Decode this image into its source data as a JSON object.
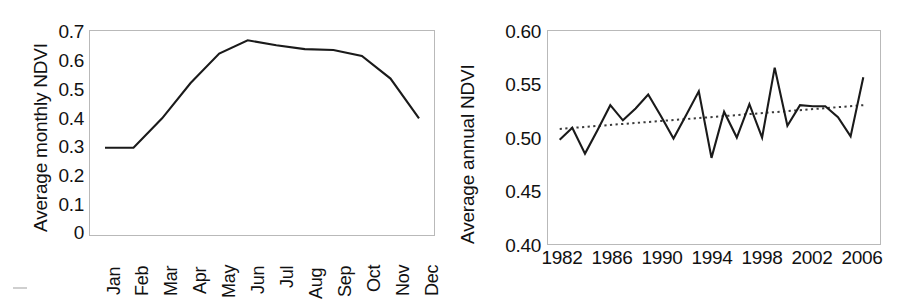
{
  "figure": {
    "background": "#ffffff",
    "line_color": "#1a1a1a",
    "trend_color": "#3a3a3a",
    "frame_color": "#b9b9b9"
  },
  "chart_data": [
    {
      "id": "monthly-ndvi",
      "type": "line",
      "title": "",
      "xlabel": "",
      "ylabel": "Average monthly NDVI",
      "categories": [
        "Jan",
        "Feb",
        "Mar",
        "Apr",
        "May",
        "Jun",
        "Jul",
        "Aug",
        "Sep",
        "Oct",
        "Nov",
        "Dec"
      ],
      "values": [
        0.3,
        0.3,
        0.4,
        0.52,
        0.62,
        0.665,
        0.648,
        0.635,
        0.632,
        0.612,
        0.535,
        0.4
      ],
      "ylim": [
        0,
        0.7
      ],
      "yticks": [
        "0.7",
        "0.6",
        "0.5",
        "0.4",
        "0.3",
        "0.2",
        "0.1",
        "0"
      ],
      "ytick_values": [
        0.7,
        0.6,
        0.5,
        0.4,
        0.3,
        0.2,
        0.1,
        0.0
      ],
      "grid": false,
      "legend": "none",
      "series": [
        {
          "name": "Average monthly NDVI",
          "style": "solid"
        }
      ]
    },
    {
      "id": "annual-ndvi",
      "type": "line",
      "title": "",
      "xlabel": "",
      "ylabel": "Average annual NDVI",
      "x": [
        1982,
        1983,
        1984,
        1985,
        1986,
        1987,
        1988,
        1989,
        1990,
        1991,
        1992,
        1993,
        1994,
        1995,
        1996,
        1997,
        1998,
        1999,
        2000,
        2001,
        2002,
        2003,
        2004,
        2005,
        2006
      ],
      "values": [
        0.498,
        0.509,
        0.485,
        0.507,
        0.53,
        0.516,
        0.527,
        0.54,
        0.52,
        0.499,
        0.521,
        0.543,
        0.481,
        0.524,
        0.5,
        0.531,
        0.5,
        0.565,
        0.511,
        0.53,
        0.529,
        0.529,
        0.519,
        0.501,
        0.556
      ],
      "trend": {
        "style": "dotted",
        "start_value": 0.508,
        "end_value": 0.53
      },
      "ylim": [
        0.4,
        0.6
      ],
      "yticks": [
        "0.60",
        "0.55",
        "0.50",
        "0.45",
        "0.40"
      ],
      "ytick_values": [
        0.6,
        0.55,
        0.5,
        0.45,
        0.4
      ],
      "xticks": [
        "1982",
        "1986",
        "1990",
        "1994",
        "1998",
        "2002",
        "2006"
      ],
      "xtick_values": [
        1982,
        1986,
        1990,
        1994,
        1998,
        2002,
        2006
      ],
      "grid": false,
      "legend": "none",
      "series": [
        {
          "name": "Average annual NDVI",
          "style": "solid"
        },
        {
          "name": "Trend",
          "style": "dotted"
        }
      ]
    }
  ]
}
